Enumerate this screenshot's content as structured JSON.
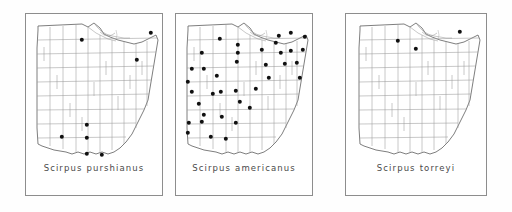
{
  "figure": {
    "type": "species-distribution-maps",
    "region": "Ohio",
    "panel_count": 3,
    "symbol": "filled-dot",
    "symbol_meaning": "county record",
    "background_color": "#ffffff",
    "line_color": "#8d8d8d",
    "dot_color": "#101010"
  },
  "panels": [
    {
      "id": "panel-purshianus",
      "caption": "Scirpus purshianus",
      "genus": "Scirpus",
      "species": "purshianus",
      "dot_count": 8,
      "dots": [
        {
          "x": 52,
          "y": 22
        },
        {
          "x": 121,
          "y": 15
        },
        {
          "x": 107,
          "y": 42
        },
        {
          "x": 57,
          "y": 107
        },
        {
          "x": 32,
          "y": 119
        },
        {
          "x": 57,
          "y": 120
        },
        {
          "x": 57,
          "y": 136
        },
        {
          "x": 72,
          "y": 137
        }
      ]
    },
    {
      "id": "panel-americanus",
      "caption": "Scirpus americanus",
      "genus": "Scirpus",
      "species": "americanus",
      "dot_count": 38,
      "dots": [
        {
          "x": 40,
          "y": 21
        },
        {
          "x": 58,
          "y": 27
        },
        {
          "x": 111,
          "y": 15
        },
        {
          "x": 125,
          "y": 19
        },
        {
          "x": 96,
          "y": 25
        },
        {
          "x": 22,
          "y": 35
        },
        {
          "x": 58,
          "y": 35
        },
        {
          "x": 82,
          "y": 32
        },
        {
          "x": 101,
          "y": 35
        },
        {
          "x": 111,
          "y": 33
        },
        {
          "x": 123,
          "y": 32
        },
        {
          "x": 12,
          "y": 51
        },
        {
          "x": 24,
          "y": 51
        },
        {
          "x": 57,
          "y": 44
        },
        {
          "x": 105,
          "y": 46
        },
        {
          "x": 8,
          "y": 64
        },
        {
          "x": 37,
          "y": 58
        },
        {
          "x": 120,
          "y": 60
        },
        {
          "x": 12,
          "y": 74
        },
        {
          "x": 33,
          "y": 76
        },
        {
          "x": 41,
          "y": 74
        },
        {
          "x": 56,
          "y": 73
        },
        {
          "x": 76,
          "y": 71
        },
        {
          "x": 19,
          "y": 86
        },
        {
          "x": 60,
          "y": 84
        },
        {
          "x": 24,
          "y": 97
        },
        {
          "x": 9,
          "y": 105
        },
        {
          "x": 22,
          "y": 104
        },
        {
          "x": 42,
          "y": 99
        },
        {
          "x": 56,
          "y": 105
        },
        {
          "x": 8,
          "y": 115
        },
        {
          "x": 31,
          "y": 119
        },
        {
          "x": 46,
          "y": 121
        },
        {
          "x": 70,
          "y": 90
        },
        {
          "x": 89,
          "y": 60
        },
        {
          "x": 99,
          "y": 18
        },
        {
          "x": 117,
          "y": 45
        },
        {
          "x": 86,
          "y": 47
        }
      ]
    },
    {
      "id": "panel-forreyi",
      "caption": "Scirpus torreyi",
      "genus": "Scirpus",
      "species": "torreyi",
      "dot_count": 3,
      "dots": [
        {
          "x": 48,
          "y": 23
        },
        {
          "x": 66,
          "y": 31
        },
        {
          "x": 110,
          "y": 14
        }
      ]
    }
  ]
}
